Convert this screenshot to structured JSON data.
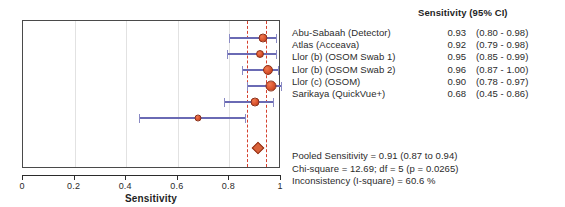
{
  "chart_data": {
    "type": "forest",
    "title": "",
    "xlabel": "Sensitivity",
    "ylabel": "",
    "xlim": [
      0,
      1
    ],
    "xticks": [
      "0",
      "0.2",
      "0.4",
      "0.6",
      "0.8",
      "1"
    ],
    "xtick_values": [
      0,
      0.2,
      0.4,
      0.6,
      0.8,
      1
    ],
    "grid": true,
    "legend": "none",
    "column_header": "Sensitivity (95% CI)",
    "categories": [
      "Abu-Sabaah (Detector)",
      "Atlas (Acceava)",
      "Llor (b) (OSOM Swab 1)",
      "Llor (b) (OSOM Swab 2)",
      "Llor (c) (OSOM)",
      "Sarikaya (QuickVue+)"
    ],
    "values": [
      0.93,
      0.92,
      0.95,
      0.96,
      0.9,
      0.68
    ],
    "ci_low": [
      0.8,
      0.79,
      0.85,
      0.87,
      0.78,
      0.45
    ],
    "ci_high": [
      0.98,
      0.98,
      0.99,
      1.0,
      0.97,
      0.86
    ],
    "ci_labels": [
      "(0.80 - 0.98)",
      "(0.79 - 0.98)",
      "(0.85 - 0.99)",
      "(0.87 - 1.00)",
      "(0.78 - 0.97)",
      "(0.45 - 0.86)"
    ],
    "value_labels": [
      "0.93",
      "0.92",
      "0.95",
      "0.96",
      "0.90",
      "0.68"
    ],
    "marker_sizes": [
      9,
      8,
      10,
      11,
      9,
      7
    ],
    "pooled": {
      "value": 0.91,
      "ci_low": 0.87,
      "ci_high": 0.94
    },
    "reference_lines": [
      0.87,
      0.94
    ],
    "colors": {
      "marker": "#d9522c",
      "marker_edge": "#8e2f16",
      "ci_line": "#6a6ab4",
      "reference_line": "#d4402e",
      "diamond": "#d9623a",
      "axis": "#2b2b2b",
      "grid": "#e2e2e2",
      "frame": "#4a4a4a"
    }
  },
  "studies": [
    {
      "name": "Abu-Sabaah (Detector)",
      "estimate": "0.93",
      "ci": "(0.80 - 0.98)"
    },
    {
      "name": "Atlas (Acceava)",
      "estimate": "0.92",
      "ci": "(0.79 - 0.98)"
    },
    {
      "name": "Llor (b) (OSOM Swab 1)",
      "estimate": "0.95",
      "ci": "(0.85 - 0.99)"
    },
    {
      "name": "Llor (b) (OSOM Swab 2)",
      "estimate": "0.96",
      "ci": "(0.87 - 1.00)"
    },
    {
      "name": "Llor (c) (OSOM)",
      "estimate": "0.90",
      "ci": "(0.78 - 0.97)"
    },
    {
      "name": "Sarikaya (QuickVue+)",
      "estimate": "0.68",
      "ci": "(0.45 - 0.86)"
    }
  ],
  "header": {
    "column_title": "Sensitivity (95% CI)"
  },
  "axis": {
    "title": "Sensitivity",
    "ticks": [
      "0",
      "0.2",
      "0.4",
      "0.6",
      "0.8",
      "1"
    ]
  },
  "summary": {
    "pooled_sensitivity": "Pooled Sensitivity = 0.91 (0.87 to 0.94)",
    "chi_square": "Chi-square = 12.69; df =  5 (p = 0.0265)",
    "inconsistency": "Inconsistency (I-square) = 60.6 %"
  }
}
